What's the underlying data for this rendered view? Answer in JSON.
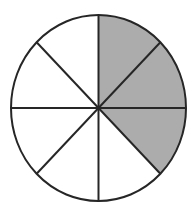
{
  "figure": {
    "name": "fraction-circle-diagram",
    "type": "pie",
    "total_sectors": 8,
    "shaded_sectors": 3,
    "unshaded_sectors": 5,
    "fraction_shaded": "3/8",
    "sector_angle_degrees": 45,
    "background_color": "#ffffff",
    "shaded_color": "#acacac",
    "unshaded_color": "#ffffff",
    "line_color": "#262626",
    "line_width": 2,
    "geometry": {
      "center_x": 98.5,
      "center_y": 108,
      "radius_x": 87.5,
      "radius_y": 93
    },
    "sectors": [
      {
        "index": 0,
        "start_angle": 90,
        "end_angle": 45,
        "shaded": true
      },
      {
        "index": 1,
        "start_angle": 45,
        "end_angle": 0,
        "shaded": true
      },
      {
        "index": 2,
        "start_angle": 0,
        "end_angle": -45,
        "shaded": true
      },
      {
        "index": 3,
        "start_angle": -45,
        "end_angle": -90,
        "shaded": false
      },
      {
        "index": 4,
        "start_angle": -90,
        "end_angle": -135,
        "shaded": false
      },
      {
        "index": 5,
        "start_angle": -135,
        "end_angle": 180,
        "shaded": false
      },
      {
        "index": 6,
        "start_angle": 180,
        "end_angle": 135,
        "shaded": false
      },
      {
        "index": 7,
        "start_angle": 135,
        "end_angle": 90,
        "shaded": false
      }
    ],
    "dividers": [
      {
        "name": "vertical-diameter",
        "angle_degrees": 90
      },
      {
        "name": "horizontal-diameter",
        "angle_degrees": 0
      },
      {
        "name": "diagonal-diameter-45",
        "angle_degrees": 45
      },
      {
        "name": "diagonal-diameter-135",
        "angle_degrees": 135
      }
    ]
  },
  "chart_data": {
    "type": "pie",
    "title": "",
    "subtitle": "",
    "xlabel": "",
    "ylabel": "",
    "grid": false,
    "legend_position": "none",
    "categories": [
      "sector-1",
      "sector-2",
      "sector-3",
      "sector-4",
      "sector-5",
      "sector-6",
      "sector-7",
      "sector-8"
    ],
    "values": [
      12.5,
      12.5,
      12.5,
      12.5,
      12.5,
      12.5,
      12.5,
      12.5
    ],
    "slice_angles_degrees": [
      45,
      45,
      45,
      45,
      45,
      45,
      45,
      45
    ],
    "slice_fill_states": [
      "shaded",
      "shaded",
      "shaded",
      "unshaded",
      "unshaded",
      "unshaded",
      "unshaded",
      "unshaded"
    ],
    "shaded_count": 3,
    "total_count": 8,
    "fraction_shaded": 0.375,
    "fraction_shaded_label": "3/8",
    "percent_shaded": 37.5,
    "annotations": []
  }
}
